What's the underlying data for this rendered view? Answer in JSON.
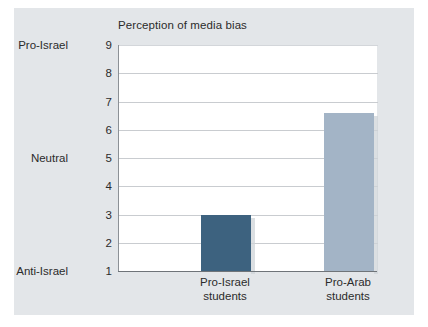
{
  "chart_data": {
    "type": "bar",
    "title": "Perception of media bias",
    "xlabel": "",
    "ylabel": "",
    "categories": [
      "Pro-Israel students",
      "Pro-Arab students"
    ],
    "category_lines": [
      [
        "Pro-Israel",
        "students"
      ],
      [
        "Pro-Arab",
        "students"
      ]
    ],
    "values": [
      3.0,
      6.6
    ],
    "ylim": [
      1,
      9
    ],
    "yticks": [
      1,
      2,
      3,
      4,
      5,
      6,
      7,
      8,
      9
    ],
    "ytick_labels": [
      "1",
      "2",
      "3",
      "4",
      "5",
      "6",
      "7",
      "8",
      "9"
    ],
    "y_category_labels": [
      {
        "value": 9,
        "label": "Pro-Israel"
      },
      {
        "value": 5,
        "label": "Neutral"
      },
      {
        "value": 1,
        "label": "Anti-Israel"
      }
    ],
    "grid": true,
    "legend": "none",
    "bar_colors": [
      "#3d627f",
      "#a3b4c6"
    ]
  },
  "colors": {
    "panel_background": "#e3e6e9",
    "page_background": "#ffffff",
    "plot_background": "#ffffff",
    "gridline": "#c9ccd0",
    "axis": "#6f7479",
    "text": "#2b2b2b",
    "bar_dark": "#3d627f",
    "bar_light": "#a3b4c6"
  }
}
